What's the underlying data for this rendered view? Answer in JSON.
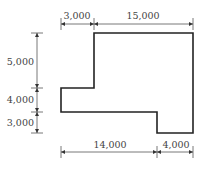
{
  "diagram": {
    "type": "floor-plan-dimensions",
    "stroke_color": "#222222",
    "dim_color": "#555555",
    "top_dimensions": [
      "3,000",
      "15,000"
    ],
    "left_dimensions": [
      "5,000",
      "4,000",
      "3,000"
    ],
    "bottom_dimensions": [
      "14,000",
      "4,000"
    ]
  }
}
